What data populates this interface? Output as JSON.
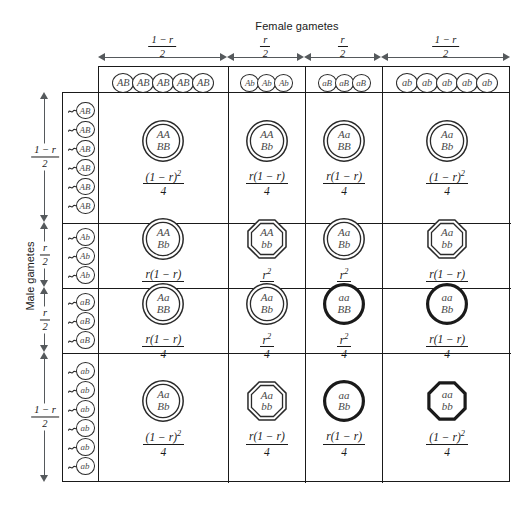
{
  "axes": {
    "female_title": "Female gametes",
    "male_title": "Male gametes",
    "column_groups": [
      {
        "gamete": "AB",
        "count": 5,
        "freq_num": "1 − r",
        "freq_den": "2",
        "size": 22
      },
      {
        "gamete": "Ab",
        "count": 3,
        "freq_num": "r",
        "freq_den": "2",
        "size": 19
      },
      {
        "gamete": "aB",
        "count": 3,
        "freq_num": "r",
        "freq_den": "2",
        "size": 19
      },
      {
        "gamete": "ab",
        "count": 5,
        "freq_num": "1 − r",
        "freq_den": "2",
        "size": 22
      }
    ],
    "row_groups": [
      {
        "gamete": "AB",
        "count": 6,
        "freq_num": "1 − r",
        "freq_den": "2",
        "size": 19
      },
      {
        "gamete": "Ab",
        "count": 3,
        "freq_num": "r",
        "freq_den": "2",
        "size": 19
      },
      {
        "gamete": "aB",
        "count": 3,
        "freq_num": "r",
        "freq_den": "2",
        "size": 19
      },
      {
        "gamete": "ab",
        "count": 6,
        "freq_num": "1 − r",
        "freq_den": "2",
        "size": 19
      }
    ]
  },
  "chart_data": {
    "type": "table",
    "xlabel": "Female gametes",
    "ylabel": "Male gametes",
    "categories": [
      "AB",
      "Ab",
      "aB",
      "ab"
    ],
    "column_frequencies": [
      "(1-r)/2",
      "r/2",
      "r/2",
      "(1-r)/2"
    ],
    "row_frequencies": [
      "(1-r)/2",
      "r/2",
      "r/2",
      "(1-r)/2"
    ],
    "cells": [
      [
        {
          "top": "AA",
          "bottom": "BB",
          "num": "(1 − r)",
          "exp": "2",
          "den": "4",
          "style": "double-circle",
          "value": "(1-r)^2/4"
        },
        {
          "top": "AA",
          "bottom": "Bb",
          "num": "r(1 − r)",
          "exp": "",
          "den": "4",
          "style": "double-circle",
          "value": "r(1-r)/4"
        },
        {
          "top": "Aa",
          "bottom": "BB",
          "num": "r(1 − r)",
          "exp": "",
          "den": "4",
          "style": "double-circle",
          "value": "r(1-r)/4"
        },
        {
          "top": "Aa",
          "bottom": "Bb",
          "num": "(1 − r)",
          "exp": "2",
          "den": "4",
          "style": "double-circle",
          "value": "(1-r)^2/4"
        }
      ],
      [
        {
          "top": "AA",
          "bottom": "Bb",
          "num": "r(1 − r)",
          "exp": "",
          "den": "4",
          "style": "double-circle",
          "value": "r(1-r)/4"
        },
        {
          "top": "AA",
          "bottom": "bb",
          "num": "r",
          "exp": "2",
          "den": "4",
          "style": "double-octagon",
          "value": "r^2/4"
        },
        {
          "top": "Aa",
          "bottom": "Bb",
          "num": "r",
          "exp": "2",
          "den": "4",
          "style": "double-circle",
          "value": "r^2/4"
        },
        {
          "top": "Aa",
          "bottom": "bb",
          "num": "r(1 − r)",
          "exp": "",
          "den": "4",
          "style": "double-octagon",
          "value": "r(1-r)/4"
        }
      ],
      [
        {
          "top": "Aa",
          "bottom": "BB",
          "num": "r(1 − r)",
          "exp": "",
          "den": "4",
          "style": "double-circle",
          "value": "r(1-r)/4"
        },
        {
          "top": "Aa",
          "bottom": "Bb",
          "num": "r",
          "exp": "2",
          "den": "4",
          "style": "double-circle",
          "value": "r^2/4"
        },
        {
          "top": "aa",
          "bottom": "BB",
          "num": "r",
          "exp": "2",
          "den": "4",
          "style": "thick-circle",
          "value": "r^2/4"
        },
        {
          "top": "aa",
          "bottom": "Bb",
          "num": "r(1 − r)",
          "exp": "",
          "den": "4",
          "style": "thick-circle",
          "value": "r(1-r)/4"
        }
      ],
      [
        {
          "top": "Aa",
          "bottom": "Bb",
          "num": "(1 − r)",
          "exp": "2",
          "den": "4",
          "style": "double-circle",
          "value": "(1-r)^2/4"
        },
        {
          "top": "Aa",
          "bottom": "bb",
          "num": "r(1 − r)",
          "exp": "",
          "den": "4",
          "style": "double-octagon",
          "value": "r(1-r)/4"
        },
        {
          "top": "aa",
          "bottom": "Bb",
          "num": "r(1 − r)",
          "exp": "",
          "den": "4",
          "style": "thick-circle",
          "value": "r(1-r)/4"
        },
        {
          "top": "aa",
          "bottom": "bb",
          "num": "(1 − r)",
          "exp": "2",
          "den": "4",
          "style": "thick-octagon",
          "value": "(1-r)^2/4"
        }
      ]
    ]
  }
}
